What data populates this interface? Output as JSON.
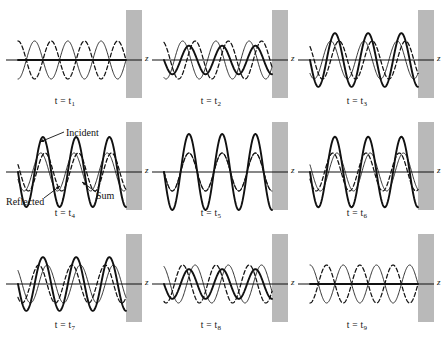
{
  "figure": {
    "axis_label": "z",
    "barrier_color": "#b9b9b9",
    "curve_color": "#111111"
  },
  "annotations": {
    "incident": "Incident",
    "reflected": "Reflected",
    "sum": "Sum"
  },
  "panels": [
    {
      "id": "p1",
      "time_label": "t = t",
      "time_sub": "1",
      "phase_deg": 0,
      "col": 0,
      "row": 0
    },
    {
      "id": "p2",
      "time_label": "t = t",
      "time_sub": "2",
      "phase_deg": 22,
      "col": 1,
      "row": 0
    },
    {
      "id": "p3",
      "time_label": "t = t",
      "time_sub": "3",
      "phase_deg": 45,
      "col": 2,
      "row": 0
    },
    {
      "id": "p4",
      "time_label": "t = t",
      "time_sub": "4",
      "phase_deg": 67,
      "col": 0,
      "row": 1
    },
    {
      "id": "p5",
      "time_label": "t = t",
      "time_sub": "5",
      "phase_deg": 90,
      "col": 1,
      "row": 1
    },
    {
      "id": "p6",
      "time_label": "t = t",
      "time_sub": "6",
      "phase_deg": 112,
      "col": 2,
      "row": 1
    },
    {
      "id": "p7",
      "time_label": "t = t",
      "time_sub": "7",
      "phase_deg": 135,
      "col": 0,
      "row": 2
    },
    {
      "id": "p8",
      "time_label": "t = t",
      "time_sub": "8",
      "phase_deg": 157,
      "col": 1,
      "row": 2
    },
    {
      "id": "p9",
      "time_label": "t = t",
      "time_sub": "9",
      "phase_deg": 180,
      "col": 2,
      "row": 2
    }
  ],
  "chart_data": {
    "type": "line",
    "xlabel": "z",
    "ylabel": "",
    "xlim": [
      0,
      3.25
    ],
    "ylim": [
      -2,
      2
    ],
    "grid": false,
    "legend_position": "inline-annotations",
    "wavelengths_shown": 3.25,
    "series": [
      {
        "name": "Incident",
        "style": "thin-solid",
        "formula": "sin(k*z - w*t)",
        "amplitude": 1
      },
      {
        "name": "Reflected",
        "style": "dashed",
        "formula": "-sin(k*z + w*t)",
        "amplitude": 1
      },
      {
        "name": "Sum",
        "style": "thick-solid",
        "formula": "incident + reflected = -2*cos(k*z)*sin(w*t)",
        "amplitude": 2
      }
    ],
    "time_phases_deg": [
      0,
      22,
      45,
      67,
      90,
      112,
      135,
      157,
      180
    ],
    "sum_envelope_by_panel": [
      2.0,
      1.85,
      1.41,
      0.77,
      0.0,
      0.77,
      1.41,
      1.85,
      2.0
    ],
    "boundary": {
      "type": "reflecting-wall",
      "position": "right",
      "node_at_wall": true
    }
  }
}
